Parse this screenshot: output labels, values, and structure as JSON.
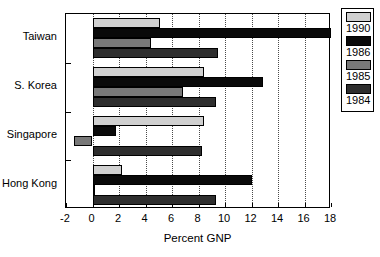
{
  "chart_data": {
    "type": "bar",
    "orientation": "horizontal",
    "title": "",
    "xlabel": "Percent GNP",
    "ylabel": "",
    "xlim": [
      -2,
      18
    ],
    "xticks": [
      -2,
      0,
      2,
      4,
      6,
      8,
      10,
      12,
      14,
      16,
      18
    ],
    "xtick_labels": [
      "-2",
      "0",
      "2",
      "4",
      "6",
      "8",
      "10",
      "12",
      "14",
      "16",
      "18"
    ],
    "grid": "vertical-dotted",
    "categories": [
      "Taiwan",
      "S. Korea",
      "Singapore",
      "Hong Kong"
    ],
    "legend_position": "right-outside",
    "series": [
      {
        "name": "1990",
        "color": "#d0d0d0",
        "values": [
          5.1,
          8.4,
          8.4,
          2.2
        ]
      },
      {
        "name": "1986",
        "color": "#0a0a0a",
        "values": [
          18.0,
          12.9,
          1.8,
          12.0
        ]
      },
      {
        "name": "1985",
        "color": "#787878",
        "values": [
          4.4,
          6.8,
          -1.4,
          0.0
        ]
      },
      {
        "name": "1984",
        "color": "#2e2e2e",
        "values": [
          9.5,
          9.3,
          8.3,
          9.3
        ]
      }
    ]
  },
  "legend": {
    "entries": [
      {
        "label": "1990",
        "color": "#d0d0d0"
      },
      {
        "label": "1986",
        "color": "#0a0a0a"
      },
      {
        "label": "1985",
        "color": "#787878"
      },
      {
        "label": "1984",
        "color": "#2e2e2e"
      }
    ]
  }
}
